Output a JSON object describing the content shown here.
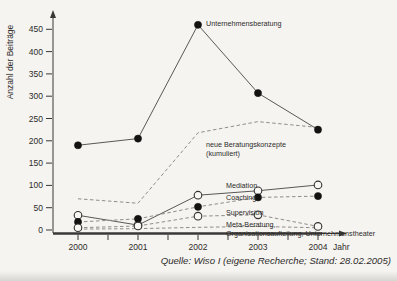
{
  "source": "Quelle: Wiso I (eigene Recherche; Stand: 28.02.2005)",
  "colors": {
    "axis": "#3a3836",
    "solid_line": "#5a5856",
    "dashed_line": "#8f8d8a",
    "marker_fill": "#131211",
    "marker_open_fill": "#f8f7f4",
    "text": "#2e2c2a",
    "source_text": "#3c3a38"
  },
  "chart_data": {
    "type": "line",
    "title": "",
    "xlabel": "Jahr",
    "ylabel": "Anzahl der Beiträge",
    "x": [
      2000,
      2001,
      2002,
      2003,
      2004
    ],
    "ylim": [
      0,
      475
    ],
    "ytick_step": 50,
    "yticks": [
      0,
      50,
      100,
      150,
      200,
      250,
      300,
      350,
      400,
      450
    ],
    "grid": false,
    "legend_position": "inline-annotations",
    "series": [
      {
        "name": "Unternehmensberatung",
        "values": [
          190,
          205,
          460,
          307,
          225
        ],
        "style": "solid",
        "marker": "filled",
        "label_lines": [
          "Unternehmensberatung"
        ],
        "label_x": 206,
        "label_y": 26
      },
      {
        "name": "neue Beratungskonzepte (kumuliert)",
        "values": [
          70,
          60,
          218,
          243,
          230
        ],
        "style": "dashed",
        "marker": "none",
        "label_lines": [
          "neue Beratungskonzepte",
          "(kumuliert)"
        ],
        "label_x": 206,
        "label_y": 147
      },
      {
        "name": "Mediation",
        "values": [
          33,
          11,
          78,
          88,
          101
        ],
        "style": "solid",
        "marker": "open",
        "label_lines": [
          "Mediation"
        ],
        "label_x": 226,
        "label_y": 188
      },
      {
        "name": "Coaching",
        "values": [
          18,
          25,
          52,
          73,
          76
        ],
        "style": "dashed",
        "marker": "filled",
        "label_lines": [
          "Coaching"
        ],
        "label_x": 226,
        "label_y": 200
      },
      {
        "name": "Supervision",
        "values": [
          5,
          9,
          31,
          34,
          8
        ],
        "style": "dashed",
        "marker": "open",
        "label_lines": [
          "Supervision"
        ],
        "label_x": 226,
        "label_y": 215
      },
      {
        "name": "Meta-Beratung, Organisationsaufteilung, Unternehmenstheater",
        "values": [
          2,
          3,
          6,
          8,
          5
        ],
        "style": "dashed",
        "marker": "none",
        "label_lines": [
          "Meta-Beratung,",
          "Organisationsaufteilung, Unternehmenstheater"
        ],
        "label_x": 226,
        "label_y": 227
      }
    ]
  }
}
